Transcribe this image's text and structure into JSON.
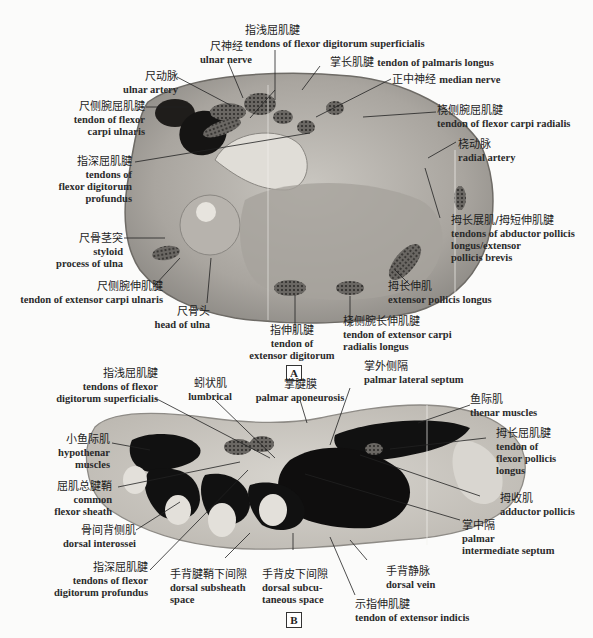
{
  "figure": {
    "panels": [
      {
        "id": "A",
        "tag": "A",
        "labels": {
          "ulnar_nerve": {
            "zh": "尺神经",
            "en": "ulnar nerve"
          },
          "fds": {
            "zh": "指浅屈肌腱",
            "en": "tendons of flexor digitorum superficialis"
          },
          "palmaris_longus": {
            "zh": "掌长肌腱",
            "en": "tendon of palmaris longus"
          },
          "median_nerve": {
            "zh": "正中神经",
            "en": "median nerve"
          },
          "ulnar_artery": {
            "zh": "尺动脉",
            "en": "ulnar artery"
          },
          "fcu": {
            "zh": "尺侧腕屈肌腱",
            "en1": "tendon of flexor",
            "en2": "carpi ulnaris"
          },
          "fcr": {
            "zh": "桡侧腕屈肌腱",
            "en": "tendon of flexor carpi radialis"
          },
          "radial_artery": {
            "zh": "桡动脉",
            "en": "radial artery"
          },
          "fdp": {
            "zh": "指深屈肌腱",
            "en1": "tendons of",
            "en2": "flexor digitorum",
            "en3": "profundus"
          },
          "apl_epb": {
            "zh": "拇长展肌/拇短伸肌腱",
            "en1": "tendons of abductor pollicis",
            "en2": "longus/extensor",
            "en3": " pollicis brevis"
          },
          "styloid": {
            "zh": "尺骨茎突",
            "en1": "styloid",
            "en2": "process of ulna"
          },
          "ecu": {
            "zh": "尺侧腕伸肌腱",
            "en": "tendon of extensor carpi ulnaris"
          },
          "epl": {
            "zh": "拇长伸肌",
            "en": "extensor pollicis longus"
          },
          "head_ulna": {
            "zh": "尺骨头",
            "en": "head of ulna"
          },
          "ed": {
            "zh": "指伸肌腱",
            "en1": "tendon of",
            "en2": "extensor digitorum"
          },
          "ecrl": {
            "zh": "桡侧腕长伸肌腱",
            "en1": "tendon of extensor carpi",
            "en2": "radialis longus"
          }
        }
      },
      {
        "id": "B",
        "tag": "B",
        "labels": {
          "fds": {
            "zh": "指浅屈肌腱",
            "en1": "tendons of  flexor",
            "en2": "digitorum superficialis"
          },
          "lumbrical": {
            "zh": "蚓状肌",
            "en": "lumbrical"
          },
          "palmar_aponeurosis": {
            "zh": "掌腱膜",
            "en": "palmar aponeurosis"
          },
          "palmar_lateral_septum": {
            "zh": "掌外侧隔",
            "en": "palmar lateral septum"
          },
          "thenar": {
            "zh": "鱼际肌",
            "en": "thenar muscles"
          },
          "hypothenar": {
            "zh": "小鱼际肌",
            "en1": "hypothenar",
            "en2": "muscles"
          },
          "fpl": {
            "zh": "拇长屈肌腱",
            "en1": "tendon of",
            "en2": "flexor pollicis",
            "en3": "longus"
          },
          "common_sheath": {
            "zh": "屈肌总腱鞘",
            "en1": "common",
            "en2": "flexor sheath"
          },
          "adductor_pollicis": {
            "zh": "拇收肌",
            "en": "adductor pollicis"
          },
          "dorsal_interossei": {
            "zh": "骨间背侧肌",
            "en": "dorsal interossei"
          },
          "palmar_intermediate": {
            "zh": "掌中隔",
            "en1": "palmar",
            "en2": "intermediate septum"
          },
          "fdp": {
            "zh": "指深屈肌腱",
            "en1": "tendons of flexor",
            "en2": "digitorum profundus"
          },
          "dorsal_subsheath": {
            "zh": "手背腱鞘下间隙",
            "en1": "dorsal subsheath",
            "en2": "space"
          },
          "dorsal_subcutaneous": {
            "zh": "手背皮下间隙",
            "en1": "dorsal subcu-",
            "en2": "taneous space"
          },
          "dorsal_vein": {
            "zh": "手背静脉",
            "en": "dorsal vein"
          },
          "extensor_indicis": {
            "zh": "示指伸肌腱",
            "en": "tendon of extensor indicis"
          }
        }
      }
    ]
  }
}
